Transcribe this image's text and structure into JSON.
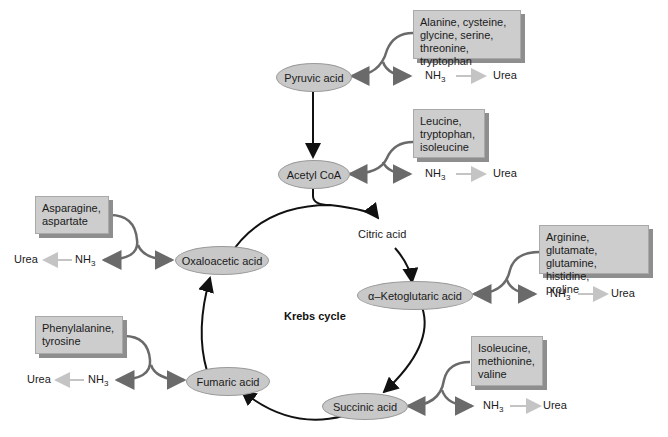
{
  "diagram": {
    "title": "Krebs cycle",
    "nodes": {
      "pyruvic": "Pyruvic acid",
      "acetyl": "Acetyl CoA",
      "citric": "Citric acid",
      "ketoglutaric": "α–Ketoglutaric acid",
      "succinic": "Succinic acid",
      "fumaric": "Fumaric acid",
      "oxaloacetic": "Oxaloacetic acid"
    },
    "amino_acid_groups": [
      {
        "target": "Pyruvic acid",
        "lines": [
          "Alanine, cysteine,",
          "glycine, serine,",
          "threonine, tryptophan"
        ]
      },
      {
        "target": "Acetyl CoA",
        "lines": [
          "Leucine,",
          "tryptophan,",
          "isoleucine"
        ]
      },
      {
        "target": "Oxaloacetic acid",
        "lines": [
          "Asparagine,",
          "aspartate"
        ]
      },
      {
        "target": "α–Ketoglutaric acid",
        "lines": [
          "Arginine, glutamate,",
          "glutamine, histidine,",
          "proline"
        ]
      },
      {
        "target": "Fumaric acid",
        "lines": [
          "Phenylalanine,",
          "tyrosine"
        ]
      },
      {
        "target": "Succinic acid",
        "lines": [
          "Isoleucine,",
          "methionine,",
          "valine"
        ]
      }
    ],
    "nh3_label": "NH",
    "nh3_sub": "3",
    "urea_label": "Urea"
  }
}
